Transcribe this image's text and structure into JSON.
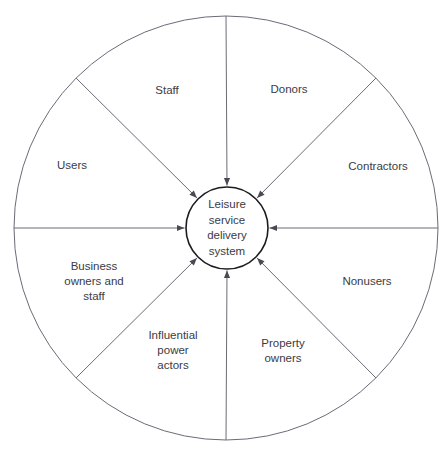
{
  "diagram": {
    "type": "radial-stakeholder-wheel",
    "core": {
      "text": "Leisure\nservice\ndelivery\nsystem",
      "cx": 227,
      "cy": 228,
      "r": 41,
      "stroke": "#1c1c20",
      "stroke_width": 1.6,
      "fill": "#ffffff"
    },
    "outer_circle": {
      "cx": 226,
      "cy": 228,
      "r": 212,
      "stroke": "#6b6b78",
      "stroke_width": 1,
      "fill": "none"
    },
    "spoke_style": {
      "stroke": "#6b6b78",
      "stroke_width": 1,
      "arrow_color": "#4a4a55"
    },
    "sectors": [
      {
        "name": "staff",
        "label": "Staff",
        "angle_deg": 270,
        "label_x": 167,
        "label_y": 90
      },
      {
        "name": "donors",
        "label": "Donors",
        "angle_deg": 315,
        "label_x": 289,
        "label_y": 89
      },
      {
        "name": "contractors",
        "label": "Contractors",
        "angle_deg": 0,
        "label_x": 378,
        "label_y": 166
      },
      {
        "name": "nonusers",
        "label": "Nonusers",
        "angle_deg": 45,
        "label_x": 367,
        "label_y": 281
      },
      {
        "name": "property-owners",
        "label": "Property\nowners",
        "angle_deg": 90,
        "label_x": 283,
        "label_y": 351
      },
      {
        "name": "influential-power-actors",
        "label": "Influential\npower\nactors",
        "angle_deg": 135,
        "label_x": 173,
        "label_y": 350
      },
      {
        "name": "business-owners-and-staff",
        "label": "Business\nowners and\nstaff",
        "angle_deg": 180,
        "label_x": 94,
        "label_y": 281
      },
      {
        "name": "users",
        "label": "Users",
        "angle_deg": 225,
        "label_x": 72,
        "label_y": 165
      }
    ]
  }
}
